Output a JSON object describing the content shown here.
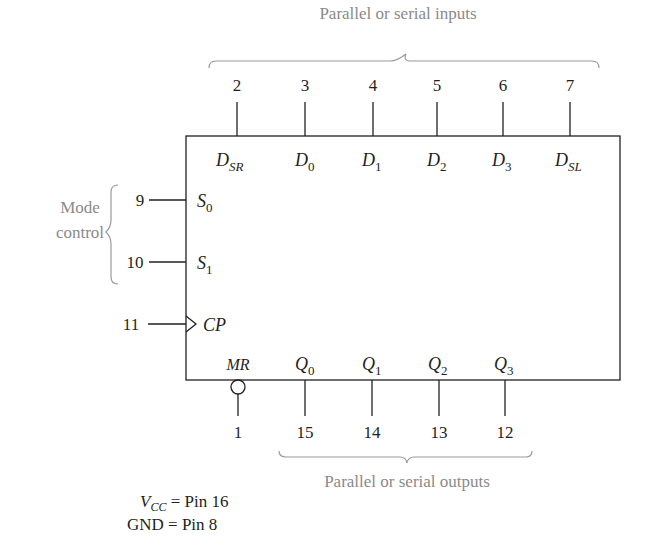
{
  "diagram": {
    "annotations": {
      "inputs_brace_label": "Parallel or serial inputs",
      "outputs_brace_label": "Parallel or serial outputs",
      "mode_control_line1": "Mode",
      "mode_control_line2": "control"
    },
    "top_pins": [
      {
        "pin": "2",
        "label_main": "D",
        "label_sub": "SR"
      },
      {
        "pin": "3",
        "label_main": "D",
        "label_sub": "0"
      },
      {
        "pin": "4",
        "label_main": "D",
        "label_sub": "1"
      },
      {
        "pin": "5",
        "label_main": "D",
        "label_sub": "2"
      },
      {
        "pin": "6",
        "label_main": "D",
        "label_sub": "3"
      },
      {
        "pin": "7",
        "label_main": "D",
        "label_sub": "SL"
      }
    ],
    "left_pins": [
      {
        "pin": "9",
        "label_main": "S",
        "label_sub": "0"
      },
      {
        "pin": "10",
        "label_main": "S",
        "label_sub": "1"
      },
      {
        "pin": "11",
        "label_main": "CP",
        "label_sub": "",
        "clock": true
      }
    ],
    "bottom_pins": [
      {
        "pin": "1",
        "label_main": "MR",
        "label_sub": "",
        "inverted": true
      },
      {
        "pin": "15",
        "label_main": "Q",
        "label_sub": "0"
      },
      {
        "pin": "14",
        "label_main": "Q",
        "label_sub": "1"
      },
      {
        "pin": "13",
        "label_main": "Q",
        "label_sub": "2"
      },
      {
        "pin": "12",
        "label_main": "Q",
        "label_sub": "3"
      }
    ],
    "power": {
      "vcc_main": "V",
      "vcc_sub": "CC",
      "vcc_rest": " = Pin 16",
      "gnd": "GND = Pin 8"
    },
    "colors": {
      "ink": "#231f20",
      "annotation": "#8a8a8a"
    }
  }
}
